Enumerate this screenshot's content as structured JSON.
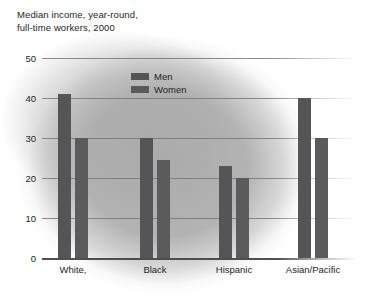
{
  "chart_data": {
    "type": "bar",
    "title": "Median income, year-round,\nfull-time workers, 2000",
    "xlabel": "",
    "ylabel": "",
    "ylim": [
      0,
      50
    ],
    "yticks": [
      "0",
      "10",
      "20",
      "30",
      "40",
      "50"
    ],
    "ytick_values": [
      0,
      10,
      20,
      30,
      40,
      50
    ],
    "grid": true,
    "legend_position": "top-center",
    "categories": [
      "White,",
      "Black",
      "Hispanic",
      "Asian/Pacific"
    ],
    "series": [
      {
        "name": "Men",
        "values": [
          41,
          30,
          23,
          40
        ],
        "color": "#555558"
      },
      {
        "name": "Women",
        "values": [
          30,
          24.5,
          20,
          30
        ],
        "color": "#5b5b5e"
      }
    ]
  },
  "legend": {
    "items": [
      {
        "label": "Men"
      },
      {
        "label": "Women"
      }
    ]
  },
  "colors": {
    "bar_men": "#555558",
    "bar_women": "#5b5b5e",
    "text": "#1e1e1e",
    "gridline": "#787878",
    "page_background": "#ffffff"
  }
}
